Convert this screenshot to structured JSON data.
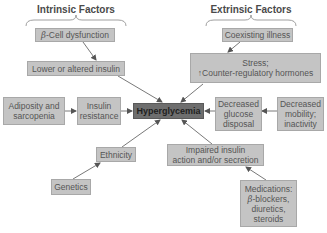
{
  "diagram": {
    "groups": {
      "intrinsic": {
        "title": "Intrinsic Factors"
      },
      "extrinsic": {
        "title": "Extrinsic Factors"
      }
    },
    "nodes": {
      "beta_cell": {
        "beta": "β",
        "label": "-Cell dysfunction"
      },
      "lower_insulin": {
        "label": "Lower or altered insulin"
      },
      "adiposity": {
        "line1": "Adiposity and",
        "line2": "sarcopenia"
      },
      "insulin_resistance": {
        "line1": "Insulin",
        "line2": "resistance"
      },
      "hyperglycemia": {
        "label": "Hyperglycemia"
      },
      "coexisting": {
        "label": "Coexisting illness"
      },
      "stress": {
        "line1": "Stress;",
        "arrow": "↑",
        "line2": "Counter-regulatory hormones"
      },
      "decreased_glucose": {
        "line1": "Decreased",
        "line2": "glucose",
        "line3": "disposal"
      },
      "decreased_mobility": {
        "line1": "Decreased",
        "line2": "mobility;",
        "line3": "inactivity"
      },
      "ethnicity": {
        "label": "Ethnicity"
      },
      "genetics": {
        "label": "Genetics"
      },
      "impaired": {
        "line1": "Impaired insulin",
        "line2": "action and/or secretion"
      },
      "medications": {
        "line1": "Medications:",
        "beta": "β",
        "line2": "-blockers,",
        "line3": "diuretics,",
        "line4": "steroids"
      }
    },
    "edges": [
      {
        "from": "β-Cell dysfunction",
        "to": "Lower or altered insulin"
      },
      {
        "from": "Lower or altered insulin",
        "to": "Hyperglycemia"
      },
      {
        "from": "Adiposity and sarcopenia",
        "to": "Insulin resistance"
      },
      {
        "from": "Insulin resistance",
        "to": "Hyperglycemia"
      },
      {
        "from": "Coexisting illness",
        "to": "Stress; ↑Counter-regulatory hormones"
      },
      {
        "from": "Stress; ↑Counter-regulatory hormones",
        "to": "Hyperglycemia"
      },
      {
        "from": "Decreased glucose disposal",
        "to": "Hyperglycemia"
      },
      {
        "from": "Decreased mobility; inactivity",
        "to": "Decreased glucose disposal"
      },
      {
        "from": "Genetics",
        "to": "Ethnicity"
      },
      {
        "from": "Ethnicity",
        "to": "Hyperglycemia"
      },
      {
        "from": "Impaired insulin action and/or secretion",
        "to": "Hyperglycemia"
      },
      {
        "from": "Medications: β-blockers, diuretics, steroids",
        "to": "Impaired insulin action and/or secretion"
      }
    ],
    "colors": {
      "node_fill": "#c4c4c4",
      "center_fill": "#6e6e6e",
      "edge": "#555555"
    }
  }
}
